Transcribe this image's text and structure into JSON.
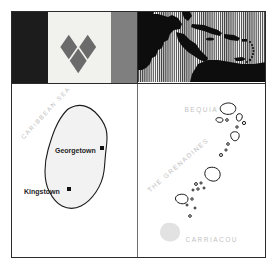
{
  "figure": {
    "kind": "flag-and-map-plate"
  },
  "flag": {
    "name": "flag-of-saint-vincent-and-the-grenadines",
    "bands": [
      {
        "name": "blue-band",
        "color": "#1c1c1c"
      },
      {
        "name": "yellow-band",
        "color": "#f1f1ee"
      },
      {
        "name": "green-band",
        "color": "#7f7f7f"
      }
    ],
    "emblem": {
      "name": "three-green-diamonds",
      "count": 3,
      "color": "#6b6b6b",
      "arrangement": "V"
    }
  },
  "locator_map": {
    "name": "caribbean-locator-map",
    "land_color": "#0d0d0d",
    "ocean_fill": "vertical-hatch",
    "ocean_stripe_color": "#3a3a3a",
    "ocean_background": "#ffffff"
  },
  "panel_left": {
    "name": "saint-vincent-island-map",
    "sea_label": "CARIBBEAN SEA",
    "island_fill": "#f2f2f2",
    "island_outline": "#1a1a1a",
    "cities": [
      {
        "name": "Georgetown",
        "marker": "square"
      },
      {
        "name": "Kingstown",
        "marker": "square"
      }
    ]
  },
  "panel_right": {
    "name": "grenadines-map",
    "labels": [
      {
        "id": "bequia",
        "text": "BEQUIA"
      },
      {
        "id": "grenadines",
        "text": "THE GRENADINES"
      },
      {
        "id": "carriacou",
        "text": "CARRIACOU"
      }
    ],
    "island_outline": "#1a1a1a",
    "island_fill": "#ffffff",
    "ghost_island_fill": "#e2e2e2"
  },
  "colors": {
    "frame": "#2b2b2b",
    "divider": "#6e6e6e",
    "label_gray": "#c2c2c2",
    "city_text": "#1f1f1f",
    "page_background": "#ffffff"
  }
}
